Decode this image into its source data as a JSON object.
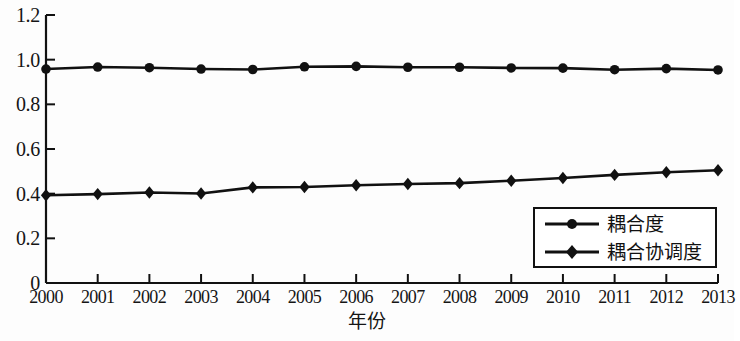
{
  "chart_data": {
    "type": "line",
    "title": "",
    "subtitle": "",
    "xlabel": "年份",
    "ylabel": "",
    "categories": [
      "2000",
      "2001",
      "2002",
      "2003",
      "2004",
      "2005",
      "2006",
      "2007",
      "2008",
      "2009",
      "2010",
      "2011",
      "2012",
      "2013"
    ],
    "x": [
      2000,
      2001,
      2002,
      2003,
      2004,
      2005,
      2006,
      2007,
      2008,
      2009,
      2010,
      2011,
      2012,
      2013
    ],
    "series": [
      {
        "name": "耦合度",
        "marker": "circle",
        "color": "#111111",
        "values": [
          0.958,
          0.967,
          0.964,
          0.958,
          0.956,
          0.968,
          0.97,
          0.966,
          0.966,
          0.963,
          0.962,
          0.955,
          0.96,
          0.954
        ]
      },
      {
        "name": "耦合协调度",
        "marker": "diamond",
        "color": "#111111",
        "values": [
          0.393,
          0.398,
          0.405,
          0.401,
          0.428,
          0.43,
          0.438,
          0.443,
          0.447,
          0.458,
          0.47,
          0.484,
          0.496,
          0.505
        ]
      }
    ],
    "ylim": [
      0,
      1.2
    ],
    "yticks": [
      0,
      0.2,
      0.4,
      0.6,
      0.8,
      1.0,
      1.2
    ],
    "ytick_labels": [
      "0",
      "0.2",
      "0.4",
      "0.6",
      "0.8",
      "1.0",
      "1.2"
    ],
    "xlim": [
      2000,
      2013
    ],
    "grid": false,
    "legend_position": "lower-right",
    "axes": {
      "left_spine": true,
      "bottom_spine": true,
      "top_spine": false,
      "right_spine": false,
      "tick_direction": "in"
    }
  },
  "legend": {
    "entries": [
      {
        "label": "耦合度",
        "marker": "circle"
      },
      {
        "label": "耦合协调度",
        "marker": "diamond"
      }
    ]
  }
}
